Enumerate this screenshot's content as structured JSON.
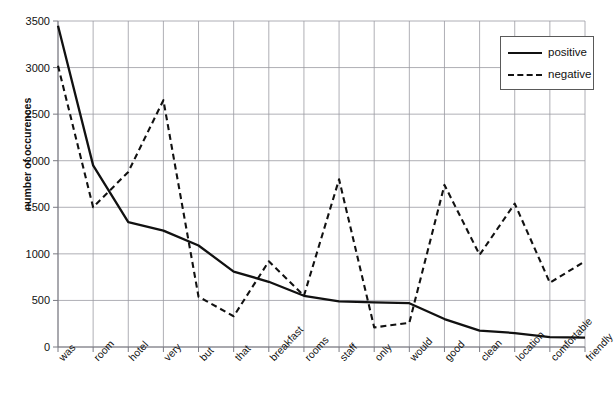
{
  "chart_data": {
    "type": "line",
    "title": "",
    "xlabel": "",
    "ylabel": "number of occurences",
    "ylim": [
      0,
      3500
    ],
    "ytick_step": 500,
    "yticks": [
      0,
      500,
      1000,
      1500,
      2000,
      2500,
      3000,
      3500
    ],
    "grid": true,
    "legend_position": "top-right",
    "categories": [
      "was",
      "room",
      "hotel",
      "very",
      "but",
      "that",
      "breakfast",
      "rooms",
      "staff",
      "only",
      "would",
      "good",
      "clean",
      "location",
      "comfortable",
      "friendly"
    ],
    "series": [
      {
        "name": "positive",
        "style": "solid",
        "color": "#111111",
        "values": [
          3450,
          1950,
          1340,
          1250,
          1090,
          810,
          700,
          550,
          490,
          480,
          470,
          300,
          175,
          150,
          105,
          100
        ]
      },
      {
        "name": "negative",
        "style": "dashed",
        "color": "#111111",
        "values": [
          3020,
          1500,
          1880,
          2650,
          540,
          330,
          920,
          550,
          1800,
          210,
          260,
          1740,
          990,
          1540,
          690,
          920
        ]
      }
    ]
  },
  "legend": {
    "items": [
      {
        "label": "positive",
        "style": "solid"
      },
      {
        "label": "negative",
        "style": "dashed"
      }
    ]
  },
  "axes": {
    "y_axis_title": "number of occurences",
    "y_tick_labels": [
      "3500",
      "3000",
      "2500",
      "2000",
      "1500",
      "1000",
      "500",
      "0"
    ],
    "x_tick_labels": [
      "was",
      "room",
      "hotel",
      "very",
      "but",
      "that",
      "breakfast",
      "rooms",
      "staff",
      "only",
      "would",
      "good",
      "clean",
      "location",
      "comfortable",
      "friendly"
    ]
  },
  "top_strip": {
    "cutoff_text": ""
  }
}
